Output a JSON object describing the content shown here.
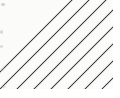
{
  "image": {
    "kind": "texture-swatch",
    "subject": "diagonal hatch stripe pattern",
    "width_px": 120,
    "height_px": 98,
    "alt_text": "Thin dark diagonal lines rising to the right on an off-white ground",
    "caption": "",
    "visible_text": ""
  },
  "pattern": {
    "name": "diagonal-hatch",
    "direction": "rising-right",
    "angle_deg": 45,
    "line_count": 11,
    "line_width_px": 1,
    "spacing_horizontal_px": 15,
    "spacing_vertical_px": 25,
    "spacing_perpendicular_px": 17.6,
    "edge_antialiasing": "present",
    "line_color": "#3a3a3c",
    "line_color_light": "#8e8e90",
    "background_color": "#fbfbfa",
    "paper_margin_color": "#ffffff"
  },
  "plate": {
    "left_px": 0,
    "top_px": 0,
    "width_px": 113,
    "height_px": 89
  },
  "margins": {
    "right_px": 7,
    "bottom_px": 9
  },
  "artifacts": {
    "label": "scan smudges",
    "marks": [
      {
        "x_px": 1,
        "y_px": 3,
        "w_px": 4,
        "h_px": 3,
        "opacity": 0.6
      },
      {
        "x_px": 0,
        "y_px": 30,
        "w_px": 3,
        "h_px": 4,
        "opacity": 0.5
      },
      {
        "x_px": 0,
        "y_px": 45,
        "w_px": 3,
        "h_px": 3,
        "opacity": 0.45
      },
      {
        "x_px": 1,
        "y_px": 68,
        "w_px": 3,
        "h_px": 3,
        "opacity": 0.4
      },
      {
        "x_px": 2,
        "y_px": 86,
        "w_px": 4,
        "h_px": 2,
        "opacity": 0.35
      }
    ]
  },
  "chart_data": {
    "type": "heatmap",
    "title": "",
    "xlabel": "",
    "ylabel": "",
    "note": "Not a data chart — uniform diagonal hatch fill sample",
    "line_offsets_x_px": [
      -28,
      -11,
      6,
      23,
      40,
      57,
      74,
      91,
      108,
      125,
      142
    ]
  }
}
